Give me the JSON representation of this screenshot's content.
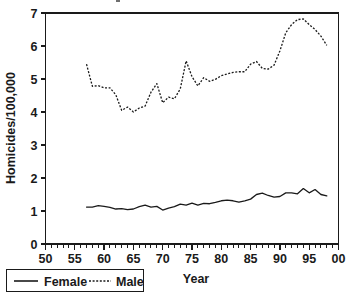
{
  "chart_data": {
    "type": "line",
    "title": "",
    "xlabel": "Year",
    "ylabel": "Homicides/100,000",
    "xlim": [
      50,
      100
    ],
    "ylim": [
      0,
      7
    ],
    "grid": false,
    "legend_position": "bottom-left",
    "x_tick_labels": [
      "50",
      "55",
      "60",
      "65",
      "70",
      "75",
      "80",
      "85",
      "90",
      "95",
      "00"
    ],
    "x_tick_values": [
      50,
      55,
      60,
      65,
      70,
      75,
      80,
      85,
      90,
      95,
      100
    ],
    "x_minor_tick_step": 1,
    "y_tick_labels": [
      "0",
      "1",
      "2",
      "3",
      "4",
      "5",
      "6",
      "7"
    ],
    "y_tick_values": [
      0,
      1,
      2,
      3,
      4,
      5,
      6,
      7
    ],
    "x": [
      57,
      58,
      59,
      60,
      61,
      62,
      63,
      64,
      65,
      66,
      67,
      68,
      69,
      70,
      71,
      72,
      73,
      74,
      75,
      76,
      77,
      78,
      79,
      80,
      81,
      82,
      83,
      84,
      85,
      86,
      87,
      88,
      89,
      90,
      91,
      92,
      93,
      94,
      95,
      96,
      97,
      98
    ],
    "series": [
      {
        "name": "Female",
        "style": "solid",
        "color": "#1a1a1a",
        "values": [
          1.12,
          1.12,
          1.16,
          1.14,
          1.11,
          1.06,
          1.07,
          1.04,
          1.06,
          1.13,
          1.18,
          1.12,
          1.14,
          1.03,
          1.09,
          1.13,
          1.21,
          1.18,
          1.24,
          1.18,
          1.23,
          1.22,
          1.26,
          1.31,
          1.33,
          1.31,
          1.27,
          1.31,
          1.36,
          1.5,
          1.54,
          1.47,
          1.42,
          1.44,
          1.55,
          1.55,
          1.52,
          1.68,
          1.55,
          1.65,
          1.5,
          1.46
        ]
      },
      {
        "name": "Male",
        "style": "dotted",
        "color": "#1a1a1a",
        "values": [
          5.45,
          4.78,
          4.8,
          4.73,
          4.73,
          4.52,
          4.05,
          4.15,
          4.0,
          4.12,
          4.18,
          4.6,
          4.86,
          4.28,
          4.45,
          4.4,
          4.7,
          5.55,
          5.07,
          4.79,
          5.04,
          4.93,
          4.99,
          5.1,
          5.15,
          5.2,
          5.22,
          5.22,
          5.45,
          5.53,
          5.32,
          5.3,
          5.42,
          5.85,
          6.4,
          6.65,
          6.8,
          6.82,
          6.65,
          6.5,
          6.3,
          6.02
        ]
      }
    ]
  },
  "axes": {
    "y_title": "Homicides/100,000",
    "x_title": "Year"
  },
  "legend": {
    "female_label": "Female",
    "male_label": "Male"
  }
}
